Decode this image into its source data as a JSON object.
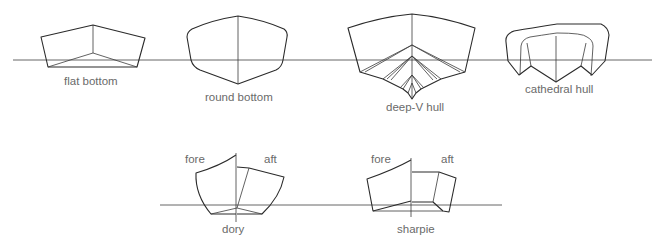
{
  "diagram": {
    "title": "",
    "colors": {
      "line": "#2a2a2a",
      "label": "#6a6a6a",
      "background": "#ffffff"
    },
    "top_row": {
      "hulls": [
        {
          "id": "flat-bottom",
          "label": "flat bottom"
        },
        {
          "id": "round-bottom",
          "label": "round bottom"
        },
        {
          "id": "deep-v-hull",
          "label": "deep-V hull"
        },
        {
          "id": "cathedral-hull",
          "label": "cathedral hull"
        }
      ]
    },
    "bottom_row": {
      "hulls": [
        {
          "id": "dory",
          "label": "dory",
          "fore_label": "fore",
          "aft_label": "aft"
        },
        {
          "id": "sharpie",
          "label": "sharpie",
          "fore_label": "fore",
          "aft_label": "aft"
        }
      ]
    }
  }
}
